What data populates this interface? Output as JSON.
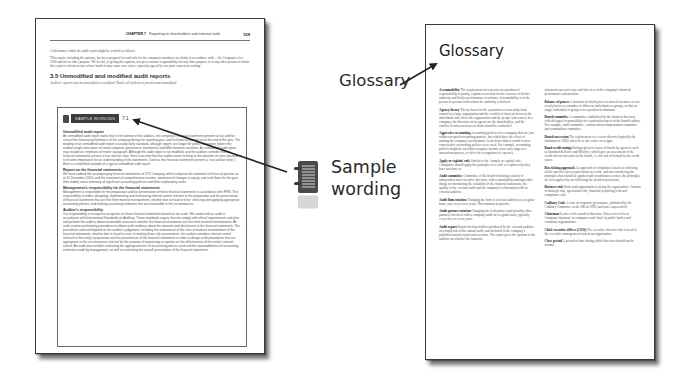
{
  "left_page": {
    "running_head": {
      "chapter": "CHAPTER 7",
      "title": "Reporting to shareholders and external audit",
      "page_number": "159"
    },
    "intro": "A disclaimer within the audit report might be worded as follows:",
    "quote": "'This report, including the opinion, has been prepared for and only for the company's members as a body in accordance with ... the Companies Act 2006 and for no other purpose. We do not, in giving this opinion, accept or assume responsibility for any other purpose or to any other person to whom this report is shown or into whose hands it may come save where expressly agreed by our prior consent in writing.'",
    "section_heading": "3.5 Unmodified and modified audit reports",
    "section_subtitle": "Auditors' reports may be unmodified or modified. Nearly all of those in practice are unmodified.",
    "sample_box": {
      "banner": "SAMPLE WORDING",
      "number": "7.1",
      "paragraphs": [
        {
          "heading": "Unmodified audit report",
          "text": "An unmodified audit report states that in the opinion of the auditors, the company's financial statements present a true and fair view of the financial performance of the company during the reporting year, and its financial position as at the end of the year. The wording of an unmodified audit report is usually fairly standard, although reports are longer for public companies (where the auditors might also report on some corporate governance statements) and differ between countries. An unmodified audit report may include an 'emphasis of matter' paragraph. Although the audit report is not modified, and the auditors consider that the financial statements present a true and fair view, there is an item that the auditor wants to bring to the attention of users because it is of some importance for an understanding of the statements. ('and so, the financial statements present a 'true and fair view'.) Here is a simplified example of a typical unmodified audit report:"
        },
        {
          "heading": "Report on the financial statements",
          "text": "We have audited the accompanying financial statements of XYZ Company, which comprise the statement of financial position as at 31 December 20X0, and the statement of comprehensive income, statement of changes in equity, and cash flows for the year then ended, and a summary of significant accounting policies and other explanatory notes."
        },
        {
          "heading": "Management's responsibility for the financial statements",
          "text": "Management is responsible for the preparation and fair presentation of these financial statements in accordance with IFRS. This responsibility includes: designing, implementing and maintaining internal control relevant to the preparation and fair presentation of financial statements that are free from material misstatement, whether due to fraud or error; selecting and applying appropriate accounting policies; and making accounting estimates that are reasonable in the circumstances."
        },
        {
          "heading": "Auditor's responsibility",
          "text": "Our responsibility is to express an opinion on these financial statements based on our audit. We conducted our audit in accordance with International Standards on Auditing. Those standards require that we comply with ethical requirements and plan and perform the audit to obtain reasonable assurance whether the financial statements are free from material misstatement. An audit involves performing procedures to obtain audit evidence about the amounts and disclosures in the financial statements. The procedures selected depend on the auditor's judgement, including the assessment of the risks of material misstatement of the financial statements, whether due to fraud or error. In making those risk assessments, the auditor considers internal control relevant to the entity's preparation and fair presentation of the financial statements in order to design audit procedures that are appropriate in the circumstances, but not for the purpose of expressing an opinion on the effectiveness of the entity's internal control. An audit also includes evaluating the appropriateness of accounting policies used and the reasonableness of accounting estimates made by management, as well as evaluating the overall presentation of the financial statements."
        }
      ]
    }
  },
  "right_page": {
    "title": "Glossary",
    "columns": [
      [
        {
          "term": "Accountability",
          "text": "The requirement for a person in a position of responsibility to justify, explain or account for the exercise of his/her authority and his/her performance or actions. Accountability is to the person or persons from whom the authority is derived."
        },
        {
          "term": "Agency theory",
          "text": "Theory based on the separation of ownership from control in a large organisation and the conflict of interests between the individuals who direct the organisation and the people who own it. In a company, the directors act as agents for the shareholders, and the conflict of interests between them should be controlled."
        },
        {
          "term": "Aggressive accounting",
          "text": "Accounting policies for a company that are just within accepted accounting practice, but which have the effect of making the company's performance seem better than it would if more conservative accounting policies were used. For example, accounting policies might be used that recognise income at an early stage in a transaction process, or defer the recognition of expenses."
        },
        {
          "term": "Apply or explain' rule",
          "text": "Similar to the 'comply or explain' rule. Companies should apply the principles of a code or explain why they have not done so."
        },
        {
          "term": "Audit committee",
          "text": "Committee of the board consisting entirely of independent non-executive directors, with responsibility amongst other things for monitoring the reliability of the financial statements, the quality of the external audit and the company's relationship with its external auditors."
        },
        {
          "term": "Audit firm rotation",
          "text": "Changing the firm of external auditors on a regular basis, say every seven years. Not common in practice."
        },
        {
          "term": "Audit partner rotation",
          "text": "Changing the lead partner (and possibly other partners) involved with a company audit on a regular basis, typically every five or seven years."
        },
        {
          "term": "Audit report",
          "text": "Report for shareholders produced by the external auditors on completion of the annual audit, and included in the company's published annual report and accounts. The report gives the opinion of the auditors on whether the financial"
        }
      ],
      [
        {
          "term": "",
          "text": "statements present a true and fair view of the company's financial performance and position."
        },
        {
          "term": "Balance of power",
          "text": "A situation in which power is shared out more or less evenly between a number of different individuals or groups, so that no single individual or group is in a position to dominate."
        },
        {
          "term": "Board committee",
          "text": "A committee established by the board of directors, with delegated responsibility for a particular aspect of the board's affairs. For example, audit committee, remuneration/compensation committee and nominations committee."
        },
        {
          "term": "Board succession",
          "text": "The replacement of a senior director (typically the chairman or CEO) when he or she retires or resigns."
        },
        {
          "term": "Bond credit ratings",
          "text": "Ratings given to issues of bonds by agencies such as Standard & Poor's and Moody's, which give an assessment of the credit risk for investors in the bonds, i.e. the risk of default by the credit issuer."
        },
        {
          "term": "Box ticking approach",
          "text": "An approach to compliance based on following all the specific rules or provisions in a code, and not considering the principles that should be applied and circumstances where the principles are best applied by not following the detailed provisions."
        },
        {
          "term": "Business risk",
          "text": "Risks (and opportunities) facing the organisation. Consists of strategic risk, operational risk, financial (reporting) risk and compliance risk."
        },
        {
          "term": "Cadbury Code",
          "text": "A code of corporate governance, published by the Cadbury Committee in the UK in 1992 (and since superseded)."
        },
        {
          "term": "Chairman",
          "text": "Leader of the board of directors. Often referred to as 'company chairman' in companies and 'chair' in public bodies and voluntary organisations."
        },
        {
          "term": "Chief executive officer (CEO)",
          "text": "The executive director who is head of the executive management team in an organisation."
        },
        {
          "term": "Close period",
          "text": "A period of time during which directors should not be normal"
        }
      ]
    ]
  },
  "callouts": {
    "glossary_label": "Glossary",
    "sample_label_line1": "Sample",
    "sample_label_line2": "wording",
    "icon": "notebook-icon"
  },
  "colors": {
    "page_border": "#3a3a3a",
    "banner_bg": "#3c3c3c",
    "label_text": "#2a2a2a",
    "arrow": "#222222"
  }
}
